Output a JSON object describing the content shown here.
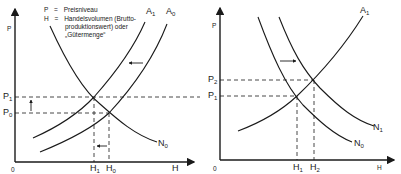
{
  "legend": {
    "p_key": "P",
    "p_eq": "=",
    "p_text": "Preisniveau",
    "h_key": "H",
    "h_eq": "=",
    "h_line1": "Handelsvolumen (Brutto-",
    "h_line2": "produktionswert) oder",
    "h_line3": "„Gütermenge“"
  },
  "left_chart": {
    "y_axis_label": "P",
    "x_axis_label": "H",
    "origin": "0",
    "price_levels": [
      {
        "name": "P",
        "sub": "1"
      },
      {
        "name": "P",
        "sub": "0"
      }
    ],
    "quantities": [
      {
        "name": "H",
        "sub": "1"
      },
      {
        "name": "H",
        "sub": "0"
      }
    ],
    "curves": [
      {
        "name": "A",
        "sub": "1"
      },
      {
        "name": "A",
        "sub": "0"
      },
      {
        "name": "N",
        "sub": "0"
      }
    ],
    "shift": "supply curve A shifts left (A0 → A1): price rises P0 → P1, quantity falls H0 → H1"
  },
  "right_chart": {
    "y_axis_label": "P",
    "x_axis_label": "H",
    "origin": "0",
    "price_levels": [
      {
        "name": "P",
        "sub": "2"
      },
      {
        "name": "P",
        "sub": "1"
      }
    ],
    "quantities": [
      {
        "name": "H",
        "sub": "1"
      },
      {
        "name": "H",
        "sub": "2"
      }
    ],
    "curves": [
      {
        "name": "A",
        "sub": "1"
      },
      {
        "name": "N",
        "sub": "1"
      },
      {
        "name": "N",
        "sub": "0"
      }
    ],
    "shift": "demand curve N shifts right (N0 → N1): price rises P1 → P2, quantity rises H1 → H2"
  }
}
